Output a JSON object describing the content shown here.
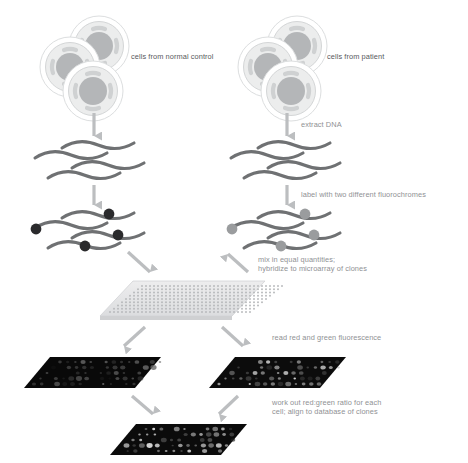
{
  "figure": {
    "background_color": "#ffffff"
  },
  "palette": {
    "text_light": "#8f9194",
    "text_dark": "#57595c",
    "arrow": "#bcbec0",
    "dna_strand": "#6f7173",
    "fluorochrome_dark": "#2a2a2c",
    "fluorochrome_light": "#9a9c9e",
    "cell_membrane": "#d9dbdc",
    "cell_nucleus": "#b2b4b6",
    "slide_face": "#e3e4e5",
    "scan_dark": "#0a0a0a",
    "scan_bright": "#121212"
  },
  "labels": {
    "normal_control": "cells from normal control",
    "patient": "cells from patient",
    "extract_dna": "extract DNA",
    "label_fluorochromes": "label with two different fluorochromes",
    "mix_line1": "mix in equal quantities;",
    "mix_line2": "hybridize to microarray of clones",
    "read_fluorescence": "read red and green fluorescence",
    "ratio_line1": "work out red:green ratio for each",
    "ratio_line2": "cell; align to database of clones"
  },
  "stages": [
    {
      "id": "cells",
      "name": "cell-clusters",
      "cells_per_cluster": 3,
      "clusters": 2
    },
    {
      "id": "dna",
      "name": "extracted-dna-strands",
      "strands_per_side": 4
    },
    {
      "id": "labeled",
      "name": "labeled-dna-strands",
      "strands_per_side": 4,
      "fluorochromes_per_side": 4
    },
    {
      "id": "microarray",
      "name": "microarray-slide",
      "grid_columns": 36,
      "grid_rows": 9
    },
    {
      "id": "scans",
      "name": "fluorescence-scans",
      "panels": 2
    },
    {
      "id": "merged",
      "name": "merged-ratio-scan",
      "panels": 1
    }
  ],
  "chart_data": {
    "type": "diagram",
    "steps": [
      "cells from normal control",
      "cells from patient",
      "extract DNA",
      "label with two different fluorochromes",
      "mix in equal quantities; hybridize to microarray of clones",
      "read red and green fluorescence",
      "work out red:green ratio for each cell; align to database of clones"
    ]
  }
}
